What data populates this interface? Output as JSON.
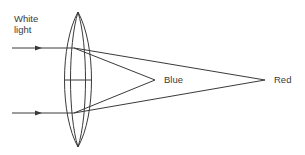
{
  "diagram": {
    "labels": {
      "input_line1": "White",
      "input_line2": "light",
      "focus_near": "Blue",
      "focus_far": "Red"
    },
    "colors": {
      "stroke": "#3a3a3a",
      "background": "#ffffff"
    },
    "elements": [
      {
        "id": "lens",
        "type": "biconvex-lens",
        "apex_top": [
          78,
          12
        ],
        "apex_bottom": [
          78,
          147
        ]
      },
      {
        "id": "incident-ray-top",
        "type": "arrow-ray",
        "y": 48
      },
      {
        "id": "incident-ray-bottom",
        "type": "arrow-ray",
        "y": 113
      },
      {
        "id": "blue-focus",
        "type": "focal-point",
        "at": [
          155,
          80
        ]
      },
      {
        "id": "red-focus",
        "type": "focal-point",
        "at": [
          265,
          80
        ]
      }
    ]
  }
}
